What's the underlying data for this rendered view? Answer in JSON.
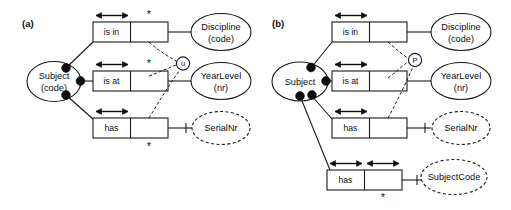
{
  "figure": {
    "background_color": "#ffffff",
    "line_color": "#1a1a1a"
  },
  "panels": [
    {
      "id": "a",
      "label": "(a)",
      "object_types": [
        {
          "name": "subject",
          "text_line1": "Subject",
          "text_line2": "(code)",
          "style": "solid-ellipse"
        },
        {
          "name": "discipline",
          "text_line1": "Discipline",
          "text_line2": "(code)",
          "style": "solid-ellipse"
        },
        {
          "name": "yearlevel",
          "text_line1": "YearLevel",
          "text_line2": "(nr)",
          "style": "solid-ellipse"
        },
        {
          "name": "serialnr",
          "text_line1": "SerialNr",
          "text_line2": "",
          "style": "dashed-ellipse"
        }
      ],
      "fact_types": [
        {
          "name": "is-in",
          "predicate": "is in",
          "frequency_marker": "*",
          "marker_position": "above"
        },
        {
          "name": "is-at",
          "predicate": "is at",
          "frequency_marker": "*",
          "marker_position": "above"
        },
        {
          "name": "has",
          "predicate": "has",
          "frequency_marker": "*",
          "marker_position": "below"
        }
      ],
      "constraint": {
        "name": "external-uniqueness",
        "symbol": "u",
        "style": "circle-dashed-leaders"
      }
    },
    {
      "id": "b",
      "label": "(b)",
      "object_types": [
        {
          "name": "subject",
          "text_line1": "Subject",
          "text_line2": "",
          "style": "solid-ellipse"
        },
        {
          "name": "discipline",
          "text_line1": "Discipline",
          "text_line2": "(code)",
          "style": "solid-ellipse"
        },
        {
          "name": "yearlevel",
          "text_line1": "YearLevel",
          "text_line2": "(nr)",
          "style": "solid-ellipse"
        },
        {
          "name": "serialnr",
          "text_line1": "SerialNr",
          "text_line2": "",
          "style": "dashed-ellipse"
        },
        {
          "name": "subjectcode",
          "text_line1": "SubjectCode",
          "text_line2": "",
          "style": "dashed-ellipse"
        }
      ],
      "fact_types": [
        {
          "name": "is-in",
          "predicate": "is in",
          "frequency_marker": "",
          "marker_position": ""
        },
        {
          "name": "is-at",
          "predicate": "is at",
          "frequency_marker": "",
          "marker_position": ""
        },
        {
          "name": "has",
          "predicate": "has",
          "frequency_marker": "",
          "marker_position": ""
        },
        {
          "name": "has-subjectcode",
          "predicate": "has",
          "frequency_marker": "*",
          "marker_position": "below"
        }
      ],
      "constraint": {
        "name": "preferred-identifier",
        "symbol": "P",
        "style": "circle-dashed-leaders"
      }
    }
  ]
}
